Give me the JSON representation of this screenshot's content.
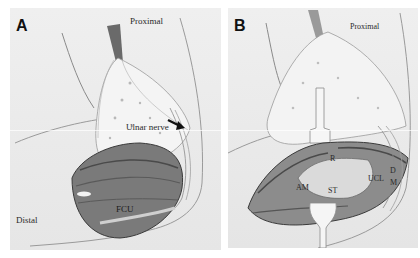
{
  "figure": {
    "panels": [
      {
        "id": "A",
        "letter": "A",
        "labels": {
          "proximal": "Proximal",
          "ulnar_nerve": "Ulnar nerve",
          "distal": "Distal",
          "fcu": "FCU"
        }
      },
      {
        "id": "B",
        "letter": "B",
        "labels": {
          "proximal": "Proximal",
          "r": "R",
          "d": "D",
          "ucl": "UCL",
          "m": "M",
          "am": "AM",
          "st": "ST"
        }
      }
    ]
  }
}
